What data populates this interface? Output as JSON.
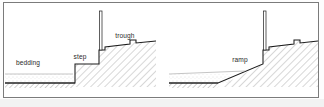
{
  "figure": {
    "panels": [
      {
        "id": "left",
        "name": "stepped-bedding-section",
        "labels": [
          {
            "key": "bedding",
            "text": "bedding",
            "x": 28,
            "y": 65
          },
          {
            "key": "step",
            "text": "step",
            "x": 74,
            "y": 57
          },
          {
            "key": "trough",
            "text": "trough",
            "x": 118,
            "y": 38
          }
        ]
      },
      {
        "id": "right",
        "name": "ramped-bedding-section",
        "labels": [
          {
            "key": "ramp",
            "text": "ramp",
            "x": 233,
            "y": 62
          }
        ]
      }
    ],
    "colors": {
      "frame_border": "#7b7b7b",
      "profile_line": "#1c1c1c",
      "hatch_line": "#9a9a9a",
      "stipple": "#b4b4b4",
      "label_text": "#2a2a2a",
      "background": "#ffffff",
      "bottom_strip": "#f2f2f2"
    },
    "elements": {
      "post_label": "post",
      "step_block_label": "step block",
      "trough_notch_label": "trough notch",
      "fill_label": "hatched fill",
      "bedding_layer_label": "bedding layer",
      "base_label": "hatched base"
    }
  }
}
